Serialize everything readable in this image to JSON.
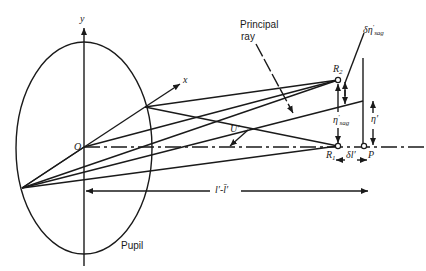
{
  "figure": {
    "type": "optical-ray-diagram",
    "labels": {
      "y_axis": "y",
      "x_axis": "x",
      "origin": "O",
      "principal_ray_line1": "Principal",
      "principal_ray_line2": "ray",
      "delta_eta_sag": "δη",
      "delta_eta_sag_sup": "′",
      "delta_eta_sag_sub": "sag",
      "R2": "R",
      "R2_sub": "2",
      "R1": "R",
      "R1_sub": "1",
      "P": "P",
      "eta_sag": "η",
      "eta_sag_sup": "′",
      "eta_sag_sub": "sag",
      "eta_prime": "η′",
      "U_prime": "U′",
      "delta_l": "δl′",
      "distance": "l′-l̄′",
      "pupil": "Pupil"
    }
  }
}
